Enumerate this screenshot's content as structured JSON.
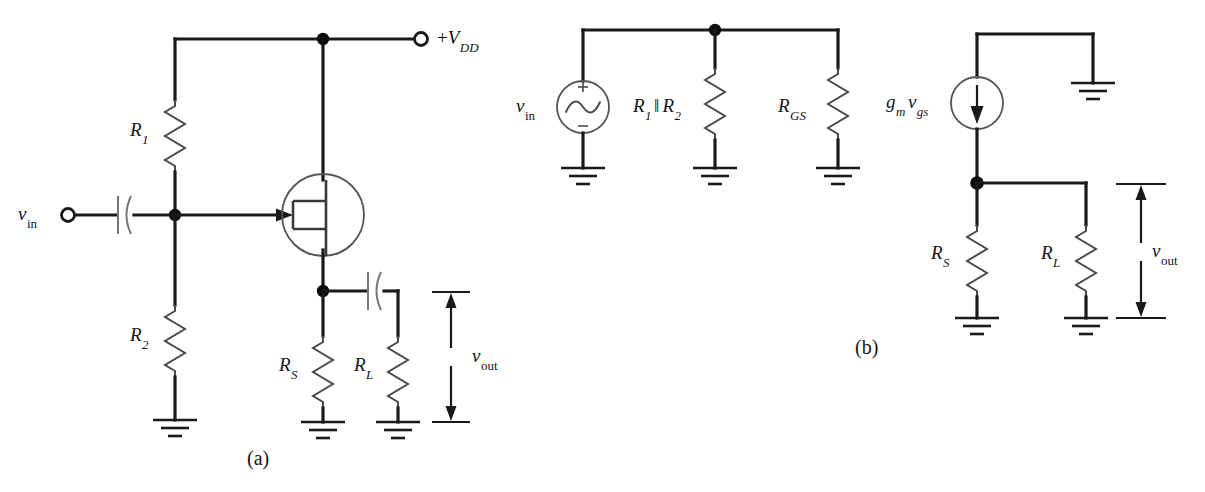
{
  "figure": {
    "background": "#ffffff",
    "wire_color": "#1a1a1a",
    "component_color": "#4a4a4a"
  },
  "captions": {
    "a": "(a)",
    "b": "(b)"
  },
  "circuit_a": {
    "name": "JFET source follower bias circuit",
    "labels": {
      "supply": {
        "sign": "+",
        "symbol": "V",
        "sub": "DD"
      },
      "input": {
        "symbol": "v",
        "sub": "in"
      },
      "r1": {
        "symbol": "R",
        "sub": "1"
      },
      "r2": {
        "symbol": "R",
        "sub": "2"
      },
      "rs": {
        "symbol": "R",
        "sub": "S"
      },
      "rl": {
        "symbol": "R",
        "sub": "L"
      },
      "vout": {
        "symbol": "v",
        "sub": "out"
      }
    },
    "components": [
      {
        "name": "resistor-r1",
        "label": "R1",
        "type": "resistor"
      },
      {
        "name": "resistor-r2",
        "label": "R2",
        "type": "resistor"
      },
      {
        "name": "resistor-rs",
        "label": "RS",
        "type": "resistor"
      },
      {
        "name": "resistor-rl",
        "label": "RL",
        "type": "resistor"
      },
      {
        "name": "jfet",
        "label": "n-channel JFET",
        "type": "transistor"
      },
      {
        "name": "input-coupling-capacitor",
        "label": "C1",
        "type": "capacitor"
      },
      {
        "name": "output-coupling-capacitor",
        "label": "C2",
        "type": "capacitor"
      },
      {
        "name": "supply-terminal",
        "label": "+VDD",
        "type": "terminal"
      },
      {
        "name": "input-terminal",
        "label": "vin",
        "type": "terminal"
      }
    ],
    "ground_count": 4
  },
  "circuit_b": {
    "name": "Small-signal equivalent circuit",
    "labels": {
      "input_source": {
        "symbol": "v",
        "sub": "in"
      },
      "r1r2": {
        "r1": "R",
        "sub1": "1",
        "par": "‖",
        "r2": "R",
        "sub2": "2"
      },
      "rgs": {
        "symbol": "R",
        "sub": "GS"
      },
      "gmvgs": {
        "g": "g",
        "gsub": "m",
        "v": "v",
        "vsub": "gs"
      },
      "rs": {
        "symbol": "R",
        "sub": "S"
      },
      "rl": {
        "symbol": "R",
        "sub": "L"
      },
      "vout": {
        "symbol": "v",
        "sub": "out"
      }
    },
    "source_signs": {
      "plus": "+",
      "minus": "−"
    },
    "components": [
      {
        "name": "ac-voltage-source",
        "label": "vin",
        "type": "ac-source"
      },
      {
        "name": "resistor-r1-parallel-r2",
        "label": "R1||R2",
        "type": "resistor"
      },
      {
        "name": "resistor-rgs",
        "label": "RGS",
        "type": "resistor"
      },
      {
        "name": "dependent-current-source",
        "label": "gm*vgs",
        "type": "current-source"
      },
      {
        "name": "resistor-rs",
        "label": "RS",
        "type": "resistor"
      },
      {
        "name": "resistor-rl",
        "label": "RL",
        "type": "resistor"
      }
    ],
    "ground_count": 6
  }
}
